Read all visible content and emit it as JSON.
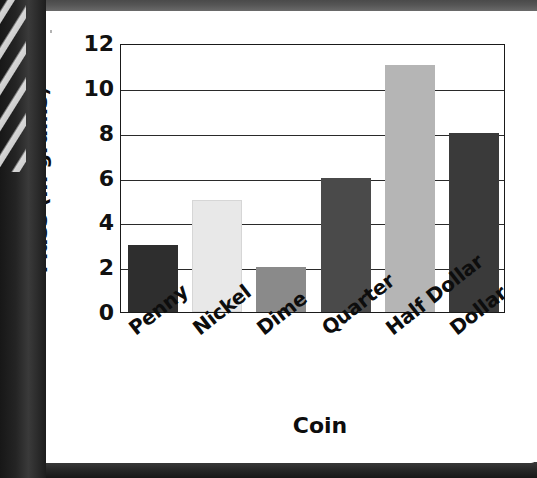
{
  "page": {
    "media": "scanned-textbook-page",
    "background_color": "#ffffff",
    "scan_edge_color": "#1d1d1d",
    "scan_band_color": "#555555"
  },
  "chart_data": {
    "type": "bar",
    "title": "",
    "xlabel": "Coin",
    "ylabel": "Mass (in grams)",
    "categories": [
      "Penny",
      "Nickel",
      "Dime",
      "Quarter",
      "Half Dollar",
      "Dollar"
    ],
    "values": [
      3,
      5,
      2,
      6,
      11,
      8
    ],
    "bar_colors": [
      "#2e2e2e",
      "#e8e8e8",
      "#8a8a8a",
      "#4a4a4a",
      "#b5b5b5",
      "#3a3a3a"
    ],
    "ylim": [
      0,
      12
    ],
    "yticks": [
      0,
      2,
      4,
      6,
      8,
      10,
      12
    ],
    "ytick_labels": [
      "0",
      "2",
      "4",
      "6",
      "8",
      "10",
      "12"
    ],
    "grid": true,
    "grid_axis": "y",
    "grid_color": "#2a2a2a",
    "legend": false,
    "legend_position": "none",
    "axis_color": "#1a1a1a",
    "plot_background": "#ffffff",
    "xtick_rotation_degrees": -38,
    "bars": [
      {
        "category": "Penny",
        "value": 3,
        "color": "#2e2e2e"
      },
      {
        "category": "Nickel",
        "value": 5,
        "color": "#e8e8e8"
      },
      {
        "category": "Dime",
        "value": 2,
        "color": "#8a8a8a"
      },
      {
        "category": "Quarter",
        "value": 6,
        "color": "#4a4a4a"
      },
      {
        "category": "Half Dollar",
        "value": 11,
        "color": "#b5b5b5"
      },
      {
        "category": "Dollar",
        "value": 8,
        "color": "#3a3a3a"
      }
    ]
  }
}
